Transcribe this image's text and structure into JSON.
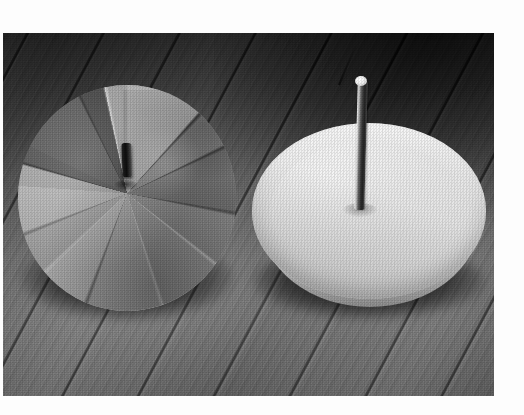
{
  "image": {
    "kind": "photograph",
    "medium": "black-and-white halftone print",
    "frame": {
      "canvas_width": 524,
      "canvas_height": 415,
      "border_color": "#ffffff",
      "photo_left": 3,
      "photo_top": 33,
      "photo_width": 491,
      "photo_height": 363
    },
    "alt": "Two round disc-shaped objects resting on a diagonally planked wooden floor. The left disc is darker and cut into radial pie-like wedges with a short pin stub at its centre; the right one is a pale shallow dish with a tall slender rod standing upright at its centre."
  },
  "scene": {
    "background": {
      "name": "wooden floor",
      "description": "hardwood planks running diagonally from lower-left to upper-right, darker toward the top of the frame",
      "base_color": "#6a6a6a",
      "light_color": "#7c7c7c",
      "dark_color": "#4a4a4a",
      "seam_color": "#2c2c2c"
    },
    "objects": [
      {
        "id": "disc-left",
        "name": "segmented disc",
        "description": "dark weathered round disc cut into radial wedge segments, short dark pin at centre",
        "position": "left of frame",
        "fill_light": "#b4b4ae",
        "fill_dark": "#4e4d49",
        "pin_color": "#1a1814",
        "segments": 10,
        "has_center_pin": true
      },
      {
        "id": "disc-right",
        "name": "dish with rod",
        "description": "pale cream shallow dish seen at an angle with a slender vertical rod standing at its centre",
        "position": "right of frame",
        "fill_light": "#f3f1ea",
        "fill_mid": "#dedbd1",
        "fill_dark": "#b6b3a9",
        "rod_color": "#2e2c28",
        "rod_highlight": "#e7e4db",
        "has_center_rod": true
      }
    ]
  }
}
